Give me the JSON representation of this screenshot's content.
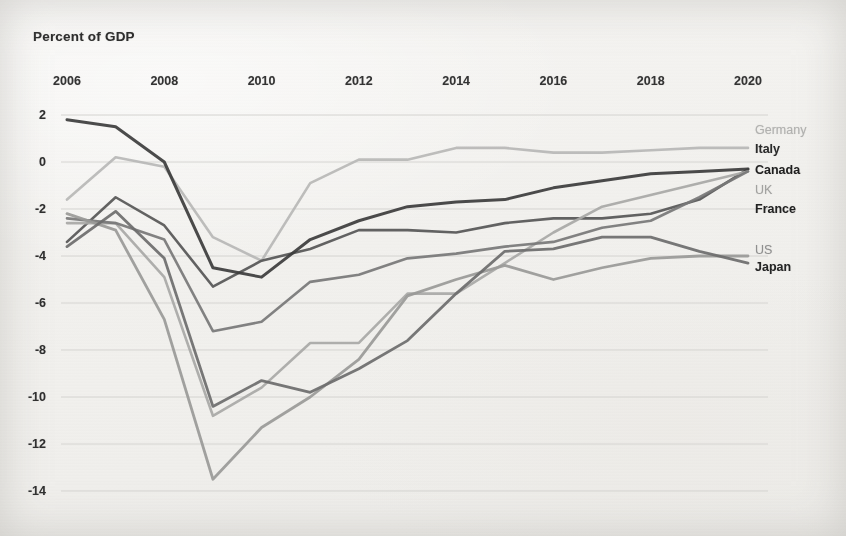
{
  "title": "Percent of GDP",
  "chart_data": {
    "type": "line",
    "title": "Percent of GDP",
    "xlabel": "",
    "ylabel": "Percent of GDP",
    "x": [
      2006,
      2007,
      2008,
      2009,
      2010,
      2011,
      2012,
      2013,
      2014,
      2015,
      2016,
      2017,
      2018,
      2019,
      2020
    ],
    "xticks": [
      2006,
      2008,
      2010,
      2012,
      2014,
      2016,
      2018,
      2020
    ],
    "yticks": [
      2,
      0,
      -2,
      -4,
      -6,
      -8,
      -10,
      -12,
      -14
    ],
    "xlim": [
      2006,
      2020
    ],
    "ylim": [
      -14,
      2
    ],
    "grid": true,
    "legend_position": "right-inline",
    "series": [
      {
        "name": "Germany",
        "color": "#b9b9b7",
        "label_color": "#b3b3b1",
        "bold": false,
        "width": 2.6,
        "values": [
          -1.6,
          0.2,
          -0.2,
          -3.2,
          -4.2,
          -0.9,
          0.1,
          0.1,
          0.6,
          0.6,
          0.4,
          0.4,
          0.5,
          0.6,
          0.6
        ]
      },
      {
        "name": "Italy",
        "color": "#565656",
        "label_color": "#2b2b2b",
        "bold": true,
        "width": 2.6,
        "values": [
          -3.4,
          -1.5,
          -2.7,
          -5.3,
          -4.2,
          -3.7,
          -2.9,
          -2.9,
          -3.0,
          -2.6,
          -2.4,
          -2.4,
          -2.2,
          -1.6,
          -0.3
        ]
      },
      {
        "name": "Canada",
        "color": "#3c3c3c",
        "label_color": "#1f1f1f",
        "bold": true,
        "width": 3.0,
        "values": [
          1.8,
          1.5,
          0.0,
          -4.5,
          -4.9,
          -3.3,
          -2.5,
          -1.9,
          -1.7,
          -1.6,
          -1.1,
          -0.8,
          -0.5,
          -0.4,
          -0.3
        ]
      },
      {
        "name": "UK",
        "color": "#a9a9a7",
        "label_color": "#a3a3a1",
        "bold": false,
        "width": 2.6,
        "values": [
          -2.6,
          -2.6,
          -4.9,
          -10.8,
          -9.6,
          -7.7,
          -7.7,
          -5.6,
          -5.6,
          -4.3,
          -3.0,
          -1.9,
          -1.4,
          -0.9,
          -0.4
        ]
      },
      {
        "name": "France",
        "color": "#787878",
        "label_color": "#222222",
        "bold": true,
        "width": 2.6,
        "values": [
          -2.4,
          -2.6,
          -3.3,
          -7.2,
          -6.8,
          -5.1,
          -4.8,
          -4.1,
          -3.9,
          -3.6,
          -3.4,
          -2.8,
          -2.5,
          -1.5,
          -0.4
        ]
      },
      {
        "name": "US",
        "color": "#9a9a98",
        "label_color": "#909090",
        "bold": false,
        "width": 2.8,
        "values": [
          -2.2,
          -2.9,
          -6.7,
          -13.5,
          -11.3,
          -10.0,
          -8.4,
          -5.7,
          -5.0,
          -4.4,
          -5.0,
          -4.5,
          -4.1,
          -4.0,
          -4.0
        ]
      },
      {
        "name": "Japan",
        "color": "#6d6d6d",
        "label_color": "#252525",
        "bold": true,
        "width": 2.8,
        "values": [
          -3.6,
          -2.1,
          -4.1,
          -10.4,
          -9.3,
          -9.8,
          -8.8,
          -7.6,
          -5.6,
          -3.8,
          -3.7,
          -3.2,
          -3.2,
          -3.8,
          -4.3
        ]
      }
    ],
    "series_label_positions": [
      {
        "name": "Germany",
        "y_px": 130
      },
      {
        "name": "Italy",
        "y_px": 149
      },
      {
        "name": "Canada",
        "y_px": 170
      },
      {
        "name": "UK",
        "y_px": 190
      },
      {
        "name": "France",
        "y_px": 209
      },
      {
        "name": "US",
        "y_px": 250
      },
      {
        "name": "Japan",
        "y_px": 267
      }
    ]
  }
}
